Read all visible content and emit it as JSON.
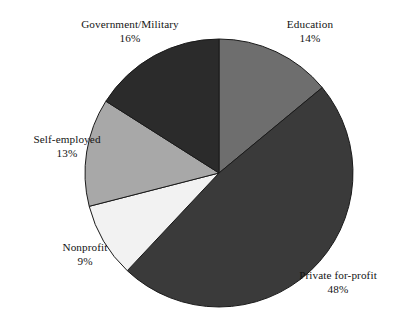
{
  "chart_data": {
    "type": "pie",
    "title": "",
    "subtitle": "",
    "xlabel": "",
    "ylabel": "",
    "legend_position": "none",
    "grid": false,
    "labels_position": "outside",
    "start_angle_deg": 0,
    "direction": "clockwise",
    "units": "percent",
    "categories": [
      "Education",
      "Private for-profit",
      "Nonprofit",
      "Self-employed",
      "Government/Military"
    ],
    "values": [
      14,
      48,
      9,
      13,
      16
    ],
    "value_labels": [
      "14%",
      "48%",
      "9%",
      "13%",
      "16%"
    ],
    "total": 100,
    "colors": [
      "#6e6e6e",
      "#3a3a3a",
      "#f2f2f2",
      "#a8a8a8",
      "#2b2b2b"
    ],
    "slice_outline_color": "#1a1a1a",
    "background_color": "#ffffff",
    "slices": [
      {
        "name": "Education",
        "value": 14,
        "value_label": "14%",
        "color": "#6e6e6e"
      },
      {
        "name": "Private for-profit",
        "value": 48,
        "value_label": "48%",
        "color": "#3a3a3a"
      },
      {
        "name": "Nonprofit",
        "value": 9,
        "value_label": "9%",
        "color": "#f2f2f2"
      },
      {
        "name": "Self-employed",
        "value": 13,
        "value_label": "13%",
        "color": "#a8a8a8"
      },
      {
        "name": "Government/Military",
        "value": 16,
        "value_label": "16%",
        "color": "#2b2b2b"
      }
    ]
  },
  "geometry": {
    "center_x": 219,
    "center_y": 173,
    "radius": 134
  },
  "labels": {
    "government_military": {
      "name": "Government/Military",
      "value": "16%"
    },
    "education": {
      "name": "Education",
      "value": "14%"
    },
    "self_employed": {
      "name": "Self-employed",
      "value": "13%"
    },
    "nonprofit": {
      "name": "Nonprofit",
      "value": "9%"
    },
    "private_for_profit": {
      "name": "Private for-profit",
      "value": "48%"
    }
  }
}
